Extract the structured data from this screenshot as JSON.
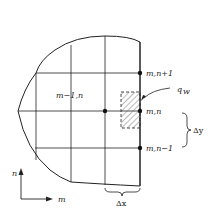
{
  "diagram": {
    "type": "finite-difference-grid-boundary-node",
    "labels": {
      "node_top": "m,n+1",
      "node_center": "m,n",
      "node_bottom": "m,n−1",
      "node_left": "m−1,n",
      "heat_flux": "q",
      "heat_flux_sub": "w",
      "delta_y": "Δy",
      "delta_x": "Δx",
      "axis_n": "n",
      "axis_m": "m"
    },
    "colors": {
      "line": "#222222",
      "hatch": "#555555",
      "background": "#ffffff"
    }
  }
}
